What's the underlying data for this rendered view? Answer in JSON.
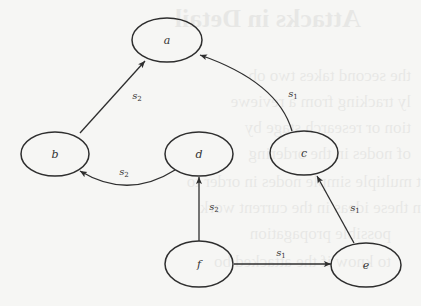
{
  "diagram": {
    "type": "directed-graph",
    "colors": {
      "background": "#f6f6f4",
      "stroke": "#2e2e2e",
      "text": "#333333"
    },
    "nodes": [
      {
        "id": "a",
        "label": "a"
      },
      {
        "id": "b",
        "label": "b"
      },
      {
        "id": "c",
        "label": "c"
      },
      {
        "id": "d",
        "label": "d"
      },
      {
        "id": "e",
        "label": "e"
      },
      {
        "id": "f",
        "label": "f"
      }
    ],
    "edges": [
      {
        "from": "b",
        "to": "a",
        "label": "s",
        "sub": "2"
      },
      {
        "from": "c",
        "to": "a",
        "label": "s",
        "sub": "1"
      },
      {
        "from": "d",
        "to": "b",
        "label": "s",
        "sub": "2"
      },
      {
        "from": "f",
        "to": "d",
        "label": "s",
        "sub": "2"
      },
      {
        "from": "e",
        "to": "c",
        "label": "s",
        "sub": "1"
      },
      {
        "from": "f",
        "to": "e",
        "label": "s",
        "sub": "1"
      }
    ]
  },
  "background_bleed": {
    "lines": [
      "Attacks in Detail",
      "the second takes two ob",
      "ly tracking from a reviewe",
      "tion or research stage by",
      "of nodes in the ordering",
      "t multiple simple nodes in order to",
      "n these ideas in the current work",
      "possible propagation",
      "to know if the attacked bo"
    ]
  }
}
